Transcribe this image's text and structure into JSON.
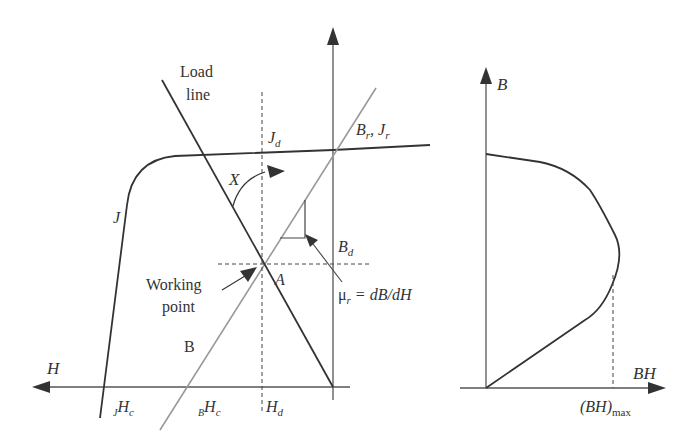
{
  "figure": {
    "left_panel": {
      "title": "Demagnetization curves with load line",
      "labels": {
        "load_line_1": "Load",
        "load_line_2": "line",
        "j_d": "J",
        "j_d_sub": "d",
        "br_jr_b": "B",
        "br_jr_b_sub": "r",
        "br_jr_sep": ", ",
        "br_jr_j": "J",
        "br_jr_j_sub": "r",
        "angle_x": "X",
        "j_curve": "J",
        "b_d": "B",
        "b_d_sub": "d",
        "working_point_1": "Working",
        "working_point_2": "point",
        "point_a": "A",
        "mu_r": "μ",
        "mu_r_sub": "r",
        "mu_r_eq": " = dB/dH",
        "b_curve": "B",
        "h_axis": "H",
        "jhc_pre": "J",
        "jhc_main": "H",
        "jhc_sub": "c",
        "bhc_pre": "B",
        "bhc_main": "H",
        "bhc_sub": "c",
        "h_d": "H",
        "h_d_sub": "d"
      }
    },
    "right_panel": {
      "title": "Energy product curve",
      "labels": {
        "b_axis": "B",
        "bh_axis": "BH",
        "bh_max": "(BH)",
        "bh_max_sub": "max"
      }
    },
    "colors": {
      "stroke_dark": "#333333",
      "stroke_gray": "#999999",
      "background": "#ffffff"
    }
  }
}
